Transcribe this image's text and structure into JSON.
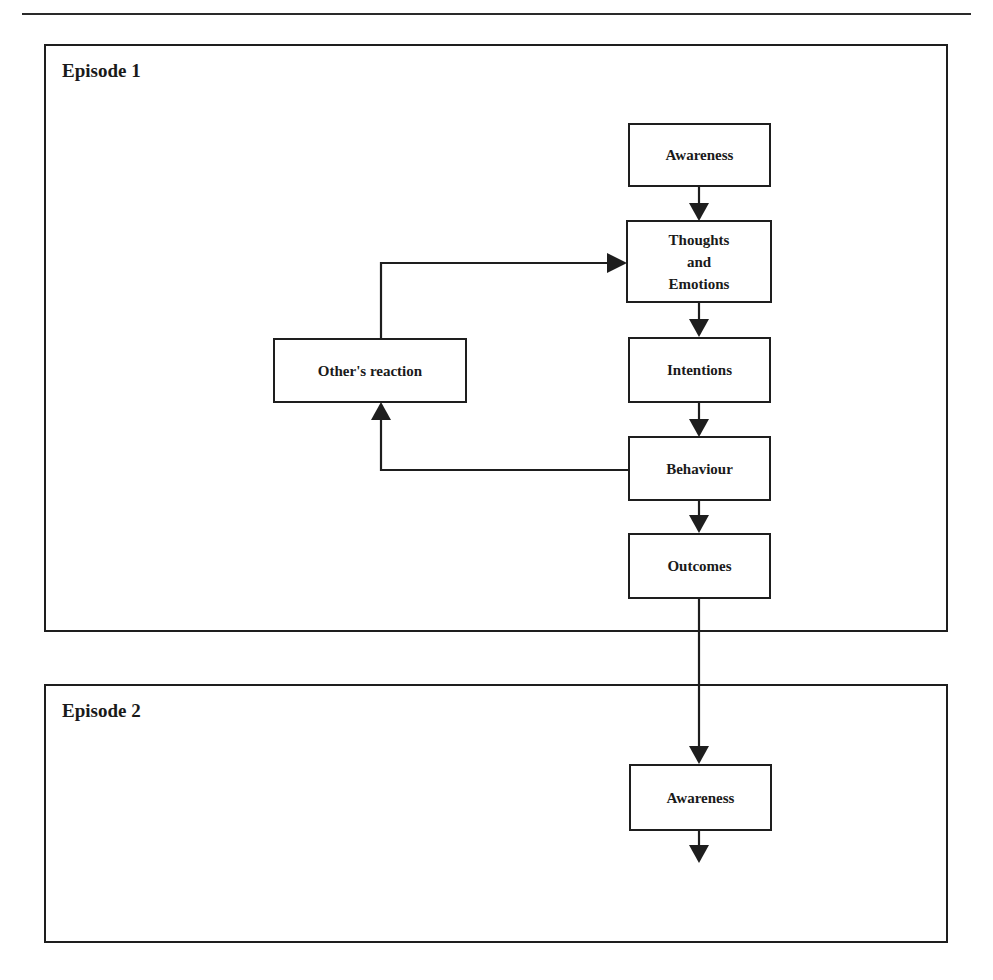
{
  "diagram": {
    "episodes": [
      {
        "label": "Episode 1"
      },
      {
        "label": "Episode 2"
      }
    ],
    "nodes": {
      "awareness_1": "Awareness",
      "thoughts_line1": "Thoughts",
      "thoughts_line2": "and",
      "thoughts_line3": "Emotions",
      "intentions": "Intentions",
      "behaviour": "Behaviour",
      "outcomes": "Outcomes",
      "others_reaction": "Other's reaction",
      "awareness_2": "Awareness"
    },
    "edges": [
      {
        "from": "Awareness",
        "to": "Thoughts and Emotions"
      },
      {
        "from": "Thoughts and Emotions",
        "to": "Intentions"
      },
      {
        "from": "Intentions",
        "to": "Behaviour"
      },
      {
        "from": "Behaviour",
        "to": "Outcomes"
      },
      {
        "from": "Behaviour",
        "to": "Other's reaction"
      },
      {
        "from": "Other's reaction",
        "to": "Thoughts and Emotions"
      },
      {
        "from": "Outcomes",
        "to": "Awareness (Episode 2)"
      },
      {
        "from": "Awareness (Episode 2)",
        "to": "(continues)"
      }
    ],
    "colors": {
      "line": "#1e1e1e",
      "background": "#ffffff"
    }
  }
}
